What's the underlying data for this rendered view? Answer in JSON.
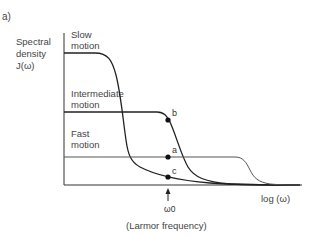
{
  "panel_label": "a)",
  "y_axis_label": [
    "Spectral",
    "density",
    "J(ω)"
  ],
  "x_axis_label": "log (ω)",
  "marker": {
    "symbol": "ω0",
    "caption": "(Larmor frequency)"
  },
  "curves": [
    {
      "name": "slow",
      "label": [
        "Slow",
        "motion"
      ]
    },
    {
      "name": "intermediate",
      "label": [
        "Intermediate",
        "motion"
      ]
    },
    {
      "name": "fast",
      "label": [
        "Fast",
        "motion"
      ]
    }
  ],
  "points": [
    {
      "id": "b",
      "label": "b"
    },
    {
      "id": "a",
      "label": "a"
    },
    {
      "id": "c",
      "label": "c"
    }
  ],
  "colors": {
    "line": "#222222",
    "fast_line": "#555555",
    "text": "#444444"
  }
}
